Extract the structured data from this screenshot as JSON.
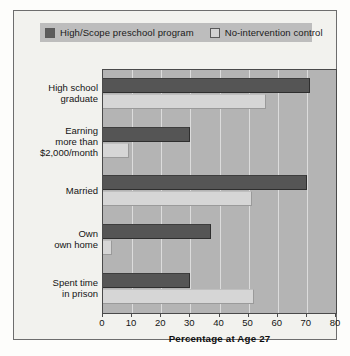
{
  "chart_data": {
    "type": "bar",
    "orientation": "horizontal",
    "title": "",
    "xlabel": "Percentage at Age 27",
    "ylabel": "",
    "xlim": [
      0,
      80
    ],
    "xticks": [
      0,
      10,
      20,
      30,
      40,
      50,
      60,
      70,
      80
    ],
    "grid": true,
    "legend_position": "top",
    "categories": [
      "High school\ngraduate",
      "Earning\nmore than\n$2,000/month",
      "Married",
      "Own\nown home",
      "Spent time\nin prison"
    ],
    "series": [
      {
        "name": "High/Scope preschool program",
        "color": "#555555",
        "values": [
          71,
          30,
          70,
          37,
          30
        ]
      },
      {
        "name": "No-intervention control",
        "color": "#d6d6d6",
        "values": [
          56,
          9,
          51,
          3,
          52
        ]
      }
    ]
  },
  "legend": {
    "entries": [
      {
        "label": "High/Scope preschool program",
        "swatch": "dark"
      },
      {
        "label": "No-intervention control",
        "swatch": "light"
      }
    ]
  },
  "colors": {
    "card_background": "#f2f2ee",
    "plot_background": "#b4b4b4",
    "legend_background": "#bdbdbd",
    "gridline": "#dcdcdc",
    "axis": "#4a4a4a",
    "series_dark": "#555555",
    "series_light": "#d6d6d6"
  }
}
